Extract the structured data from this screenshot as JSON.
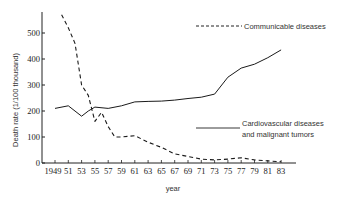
{
  "chart_data": {
    "type": "line",
    "title": "",
    "xlabel": "year",
    "ylabel": "Death rate (1/100 thousand)",
    "ylim": [
      0,
      570
    ],
    "yticks": [
      0,
      100,
      200,
      300,
      400,
      500
    ],
    "xticks": [
      "1949",
      "51",
      "53",
      "55",
      "57",
      "59",
      "61",
      "63",
      "65",
      "67",
      "69",
      "71",
      "73",
      "75",
      "77",
      "79",
      "81",
      "83"
    ],
    "grid": false,
    "legend_position": "inline annotations",
    "series": [
      {
        "name": "Communicable diseases",
        "style": "dashed",
        "x": [
          1950,
          1951,
          1952,
          1953,
          1954,
          1955,
          1956,
          1957,
          1958,
          1959,
          1961,
          1963,
          1965,
          1967,
          1969,
          1971,
          1973,
          1975,
          1977,
          1979,
          1981,
          1983
        ],
        "values": [
          570,
          520,
          460,
          300,
          260,
          160,
          195,
          140,
          100,
          100,
          105,
          80,
          60,
          35,
          25,
          15,
          12,
          15,
          20,
          12,
          8,
          5
        ]
      },
      {
        "name": "Cardiovascular diseases and malignant tumors",
        "style": "solid",
        "x": [
          1949,
          1951,
          1953,
          1954,
          1955,
          1957,
          1959,
          1961,
          1963,
          1965,
          1967,
          1969,
          1971,
          1973,
          1975,
          1977,
          1979,
          1981,
          1983
        ],
        "values": [
          210,
          220,
          180,
          200,
          215,
          210,
          220,
          235,
          237,
          238,
          242,
          248,
          253,
          265,
          330,
          365,
          380,
          405,
          435
        ]
      }
    ]
  },
  "legend": {
    "communicable": "Communicable diseases",
    "cardio_line1": "Cardiovascular diseases",
    "cardio_line2": "and malignant tumors"
  },
  "axis": {
    "xlabel": "year",
    "ylabel": "Death rate (1/100 thousand)"
  }
}
